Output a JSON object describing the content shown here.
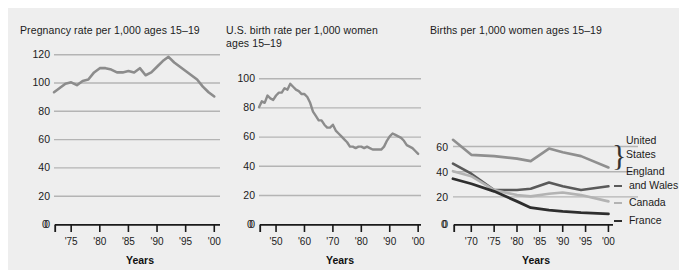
{
  "figure": {
    "background": "#eeeeee",
    "xlabel_caption": "Years",
    "grid_color": "#b4b4b4",
    "axis_color": "#1a1a1a"
  },
  "chart_data": [
    {
      "id": "pregnancy-rate",
      "type": "line",
      "title": "Pregnancy rate per 1,000 ages 15–19",
      "xlabel": "Years",
      "ylabel": "",
      "ylim": [
        0,
        120
      ],
      "yticks": [
        0,
        20,
        40,
        60,
        80,
        100,
        120
      ],
      "xlim": [
        1972,
        2001
      ],
      "xticks": [
        1975,
        1980,
        1985,
        1990,
        1995,
        2000
      ],
      "xticklabels": [
        "'75",
        "'80",
        "'85",
        "'90",
        "'95",
        "'00"
      ],
      "grid": true,
      "line_color": "#8c8c8c",
      "x": [
        1972,
        1973,
        1974,
        1975,
        1976,
        1977,
        1978,
        1979,
        1980,
        1981,
        1982,
        1983,
        1984,
        1985,
        1986,
        1987,
        1988,
        1989,
        1990,
        1991,
        1992,
        1993,
        1994,
        1995,
        1996,
        1997,
        1998,
        1999,
        2000
      ],
      "values": [
        93,
        96,
        99,
        100,
        98,
        101,
        102,
        107,
        110,
        110,
        109,
        107,
        107,
        108,
        107,
        110,
        105,
        107,
        111,
        115,
        118,
        114,
        111,
        108,
        105,
        102,
        97,
        93,
        90
      ]
    },
    {
      "id": "us-birth-rate",
      "type": "line",
      "title": "U.S. birth rate per 1,000 women\nages 15–19",
      "xlabel": "Years",
      "ylabel": "",
      "ylim": [
        0,
        100
      ],
      "yticks": [
        0,
        20,
        40,
        60,
        80,
        100
      ],
      "xlim": [
        1944,
        2001
      ],
      "xticks": [
        1950,
        1960,
        1970,
        1980,
        1990,
        2000
      ],
      "xticklabels": [
        "'50",
        "'60",
        "'70",
        "'80",
        "'90",
        "'00"
      ],
      "grid": true,
      "line_color": "#8c8c8c",
      "x": [
        1944,
        1945,
        1946,
        1947,
        1948,
        1949,
        1950,
        1951,
        1952,
        1953,
        1954,
        1955,
        1956,
        1957,
        1958,
        1959,
        1960,
        1961,
        1962,
        1963,
        1964,
        1965,
        1966,
        1967,
        1968,
        1969,
        1970,
        1971,
        1972,
        1973,
        1974,
        1975,
        1976,
        1977,
        1978,
        1979,
        1980,
        1981,
        1982,
        1983,
        1984,
        1985,
        1986,
        1987,
        1988,
        1989,
        1990,
        1991,
        1992,
        1993,
        1994,
        1995,
        1996,
        1997,
        1998,
        1999,
        2000
      ],
      "values": [
        80,
        84,
        83,
        88,
        86,
        85,
        88,
        90,
        90,
        93,
        92,
        96,
        94,
        92,
        91,
        89,
        89,
        87,
        83,
        77,
        74,
        71,
        71,
        68,
        66,
        66,
        68,
        64,
        62,
        60,
        58,
        56,
        53,
        53,
        52,
        53,
        53,
        52,
        53,
        52,
        51,
        51,
        51,
        51,
        53,
        57,
        60,
        62,
        61,
        60,
        59,
        57,
        54,
        53,
        52,
        50,
        48
      ]
    },
    {
      "id": "international-births",
      "type": "line",
      "title": "Births per 1,000 women ages 15–19",
      "xlabel": "Years",
      "ylabel": "",
      "ylim": [
        0,
        70
      ],
      "yticks": [
        0,
        20,
        40,
        60
      ],
      "xlim": [
        1966,
        2001
      ],
      "xticks": [
        1970,
        1975,
        1980,
        1985,
        1990,
        1995,
        2000
      ],
      "xticklabels": [
        "'70",
        "'75",
        "'80",
        "'85",
        "'90",
        "'95",
        "'00"
      ],
      "grid": true,
      "legend_position": "right",
      "x": [
        1966,
        1970,
        1975,
        1980,
        1983,
        1987,
        1990,
        1994,
        2000
      ],
      "series": [
        {
          "name": "United States",
          "color": "#8f8f8f",
          "values": [
            67,
            55,
            54,
            52,
            50,
            60,
            57,
            54,
            45
          ]
        },
        {
          "name": "England and Wales",
          "color": "#5a5a5a",
          "values": [
            48,
            40,
            27,
            27,
            28,
            33,
            30,
            27,
            30
          ]
        },
        {
          "name": "Canada",
          "color": "#b3b3b3",
          "values": [
            42,
            38,
            27,
            23,
            22,
            24,
            25,
            23,
            18
          ]
        },
        {
          "name": "France",
          "color": "#2e2e2e",
          "values": [
            36,
            32,
            26,
            18,
            13,
            11,
            10,
            9,
            8
          ]
        }
      ]
    }
  ],
  "legend": {
    "grouped_label_line1": "United",
    "grouped_label_line2": "States",
    "items": [
      {
        "label_line1": "England",
        "label_line2": "and Wales",
        "color": "#5a5a5a"
      },
      {
        "label_line1": "Canada",
        "label_line2": "",
        "color": "#b3b3b3"
      },
      {
        "label_line1": "France",
        "label_line2": "",
        "color": "#2e2e2e"
      }
    ]
  }
}
